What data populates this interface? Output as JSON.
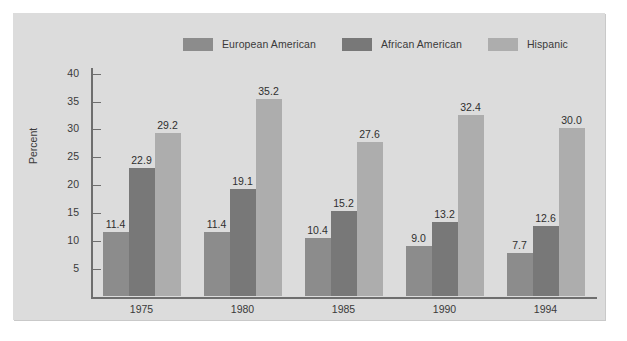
{
  "chart_data": {
    "type": "bar",
    "title": "",
    "xlabel": "Year",
    "ylabel": "Percent",
    "categories": [
      "1975",
      "1980",
      "1985",
      "1990",
      "1994"
    ],
    "series": [
      {
        "name": "European American",
        "color": "#8c8c8c",
        "values": [
          11.4,
          11.4,
          10.4,
          9.0,
          7.7
        ],
        "labels": [
          "11.4",
          "11.4",
          "10.4",
          "9.0",
          "7.7"
        ]
      },
      {
        "name": "African American",
        "color": "#787878",
        "values": [
          22.9,
          19.1,
          15.2,
          13.2,
          12.6
        ],
        "labels": [
          "22.9",
          "19.1",
          "15.2",
          "13.2",
          "12.6"
        ]
      },
      {
        "name": "Hispanic",
        "color": "#adadad",
        "values": [
          29.2,
          35.2,
          27.6,
          32.4,
          30.0
        ],
        "labels": [
          "29.2",
          "35.2",
          "27.6",
          "32.4",
          "30.0"
        ]
      }
    ],
    "ylim": [
      0,
      41
    ],
    "yticks": [
      5,
      10,
      15,
      20,
      25,
      30,
      35,
      40
    ],
    "ytick_labels": [
      "5",
      "10",
      "15",
      "20",
      "25",
      "30",
      "35",
      "40"
    ],
    "grid": false,
    "legend_position": "top"
  },
  "legend": {
    "entries": [
      {
        "label": "European American"
      },
      {
        "label": "African American"
      },
      {
        "label": "Hispanic"
      }
    ]
  },
  "axes": {
    "y_title": "Percent",
    "x_title": "Year"
  },
  "colors": {
    "panel_background": "#dcdcdc",
    "figure_background": "#ffffff",
    "axis": "#6e6e6e",
    "text": "#3a3a3a",
    "series_1": "#8c8c8c",
    "series_2": "#787878",
    "series_3": "#adadad"
  }
}
